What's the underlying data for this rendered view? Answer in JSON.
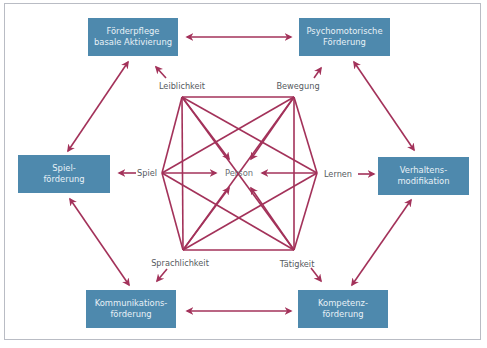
{
  "diagram": {
    "colors": {
      "box_fill": "#4e89ad",
      "box_text": "#e8f1f7",
      "line": "#a3325a",
      "label_text": "#555a60",
      "frame": "#b9bcc4"
    },
    "center": {
      "label": "Person"
    },
    "aspects": {
      "leiblichkeit": "Leiblichkeit",
      "bewegung": "Bewegung",
      "spiel": "Spiel",
      "lernen": "Lernen",
      "sprachlichkeit": "Sprachlichkeit",
      "taetigkeit": "Tätigkeit"
    },
    "boxes": {
      "foerderpflege": {
        "line1": "Förderpflege",
        "line2": "basale Aktivierung"
      },
      "psychomotorik": {
        "line1": "Psychomotorische",
        "line2": "Förderung"
      },
      "spielfoerderung": {
        "line1": "Spiel-",
        "line2": "förderung"
      },
      "verhalten": {
        "line1": "Verhaltens-",
        "line2": "modifikation"
      },
      "kommunikation": {
        "line1": "Kommunikations-",
        "line2": "förderung"
      },
      "kompetenz": {
        "line1": "Kompetenz-",
        "line2": "förderung"
      }
    },
    "connections": [
      {
        "from": "Förderpflege basale Aktivierung",
        "to": "Psychomotorische Förderung",
        "type": "bidirectional"
      },
      {
        "from": "Psychomotorische Förderung",
        "to": "Verhaltensmodifikation",
        "type": "bidirectional"
      },
      {
        "from": "Verhaltensmodifikation",
        "to": "Kompetenzförderung",
        "type": "bidirectional"
      },
      {
        "from": "Kompetenzförderung",
        "to": "Kommunikationsförderung",
        "type": "bidirectional"
      },
      {
        "from": "Kommunikationsförderung",
        "to": "Spielförderung",
        "type": "bidirectional"
      },
      {
        "from": "Spielförderung",
        "to": "Förderpflege basale Aktivierung",
        "type": "bidirectional"
      },
      {
        "from": "Leiblichkeit",
        "to": "Förderpflege basale Aktivierung",
        "type": "directed"
      },
      {
        "from": "Bewegung",
        "to": "Psychomotorische Förderung",
        "type": "directed"
      },
      {
        "from": "Spiel",
        "to": "Spielförderung",
        "type": "directed"
      },
      {
        "from": "Lernen",
        "to": "Verhaltensmodifikation",
        "type": "directed"
      },
      {
        "from": "Sprachlichkeit",
        "to": "Kommunikationsförderung",
        "type": "directed"
      },
      {
        "from": "Tätigkeit",
        "to": "Kompetenzförderung",
        "type": "directed"
      },
      {
        "from": "all aspects",
        "to": "Person",
        "type": "directed"
      },
      {
        "from": "all aspects",
        "to": "all aspects",
        "type": "network"
      }
    ]
  }
}
